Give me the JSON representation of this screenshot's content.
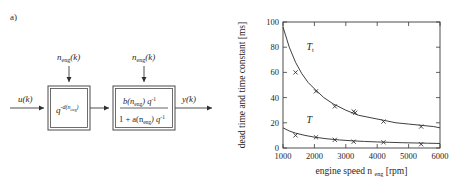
{
  "figure": {
    "panel_a_label": "a)",
    "panel_b_label": "b)"
  },
  "diagram": {
    "input_signal": "u(k)",
    "output_signal": "y(k)",
    "scheduling_input_1": "n",
    "scheduling_input_1_sub": "eng",
    "scheduling_input_1_tail": "(k)",
    "scheduling_input_2": "n",
    "scheduling_input_2_sub": "eng",
    "scheduling_input_2_tail": "(k)",
    "block1": {
      "base": "q",
      "exponent_main": "-d(n",
      "exponent_sub": "eng",
      "exponent_tail": ")"
    },
    "block2": {
      "numerator_b": "b(n",
      "numerator_sub": "eng",
      "numerator_tail": ") q",
      "numerator_power": "-1",
      "denominator_lead": "1 + a(n",
      "denominator_sub": "eng",
      "denominator_tail": ") q",
      "denominator_power": "-1"
    }
  },
  "chart_data": {
    "type": "line",
    "title": "",
    "xlabel_main": "engine speed n",
    "xlabel_sub": "eng",
    "xlabel_unit": "[rpm]",
    "ylabel_main": "dead time and time constant",
    "ylabel_unit": "[ms]",
    "xlim": [
      1000,
      6000
    ],
    "ylim": [
      0,
      100
    ],
    "xticks": [
      1000,
      2000,
      3000,
      4000,
      5000,
      6000
    ],
    "yticks": [
      0,
      20,
      40,
      60,
      80,
      100
    ],
    "grid": false,
    "legend_position": "inline-annotation",
    "annotations": [
      {
        "text": "T",
        "sub": "t",
        "x": 1750,
        "y": 78
      },
      {
        "text": "T",
        "sub": "",
        "x": 1750,
        "y": 20
      }
    ],
    "series": [
      {
        "name": "T_t",
        "label": "time constant",
        "marker": "x",
        "fit_curve": {
          "form": "hyperbolic",
          "points_x": [
            1000,
            1200,
            1400,
            1600,
            1800,
            2000,
            2300,
            2600,
            3000,
            3400,
            3800,
            4200,
            4600,
            5000,
            5400,
            5800,
            6000
          ],
          "points_y": [
            96,
            80,
            68,
            59,
            52,
            47,
            40,
            35,
            30,
            26,
            24,
            22,
            20,
            19,
            18,
            17,
            16
          ]
        },
        "data_x": [
          1400,
          2050,
          2650,
          3250,
          3300,
          4200,
          5400
        ],
        "data_y": [
          60,
          45,
          33,
          29,
          28,
          21,
          17
        ]
      },
      {
        "name": "T",
        "label": "dead time",
        "marker": "x",
        "fit_curve": {
          "form": "hyperbolic",
          "points_x": [
            1000,
            1200,
            1400,
            1700,
            2000,
            2400,
            2800,
            3200,
            3600,
            4000,
            4400,
            4800,
            5200,
            5600,
            6000
          ],
          "points_y": [
            16,
            13.5,
            11.8,
            10,
            8.6,
            7.3,
            6.4,
            5.7,
            5.2,
            4.8,
            4.5,
            4.2,
            4.0,
            3.8,
            3.6
          ]
        },
        "data_x": [
          1400,
          2050,
          2650,
          3250,
          4200,
          5400
        ],
        "data_y": [
          10,
          8.5,
          6.5,
          5,
          4.5,
          3
        ]
      }
    ]
  }
}
